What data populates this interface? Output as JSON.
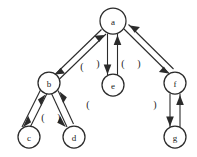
{
  "diagram": {
    "type": "directed-graph",
    "title": "",
    "background_color": "#ffffff",
    "stroke_color": "#2b2b2b",
    "nodes": [
      {
        "id": "a",
        "label": "a",
        "cx": 113,
        "cy": 21,
        "r": 13
      },
      {
        "id": "b",
        "label": "b",
        "cx": 49,
        "cy": 83,
        "r": 11
      },
      {
        "id": "c",
        "label": "c",
        "cx": 29,
        "cy": 137,
        "r": 11
      },
      {
        "id": "d",
        "label": "d",
        "cx": 74,
        "cy": 137,
        "r": 11
      },
      {
        "id": "e",
        "label": "e",
        "cx": 113,
        "cy": 85,
        "r": 11
      },
      {
        "id": "f",
        "label": "f",
        "cx": 175,
        "cy": 83,
        "r": 11
      },
      {
        "id": "g",
        "label": "g",
        "cx": 175,
        "cy": 137,
        "r": 11
      }
    ],
    "edges": [
      {
        "id": "a-b",
        "from": "a",
        "to": "b",
        "bidirectional": true
      },
      {
        "id": "a-e",
        "from": "a",
        "to": "e",
        "bidirectional": true
      },
      {
        "id": "a-f",
        "from": "a",
        "to": "f",
        "bidirectional": true
      },
      {
        "id": "b-c",
        "from": "b",
        "to": "c",
        "bidirectional": true
      },
      {
        "id": "b-d",
        "from": "b",
        "to": "d",
        "bidirectional": true
      },
      {
        "id": "f-g",
        "from": "f",
        "to": "g",
        "bidirectional": true
      }
    ],
    "markers": [
      {
        "id": "m1",
        "glyph": "(",
        "x": 82,
        "y": 66
      },
      {
        "id": "m2",
        "glyph": ")",
        "x": 98,
        "y": 63
      },
      {
        "id": "m3",
        "glyph": "(",
        "x": 123,
        "y": 63
      },
      {
        "id": "m4",
        "glyph": ")",
        "x": 139,
        "y": 63
      },
      {
        "id": "m5",
        "glyph": "(",
        "x": 88,
        "y": 104
      },
      {
        "id": "m6",
        "glyph": "(",
        "x": 43,
        "y": 117
      },
      {
        "id": "m7",
        "glyph": ")",
        "x": 59,
        "y": 117
      },
      {
        "id": "m8",
        "glyph": ")",
        "x": 155,
        "y": 104
      }
    ]
  }
}
